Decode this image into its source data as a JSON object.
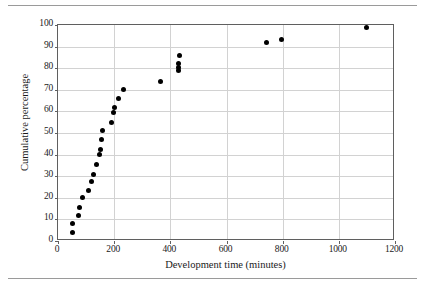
{
  "chart_data": {
    "type": "scatter",
    "title": "",
    "xlabel": "Development time (minutes)",
    "ylabel": "Cumulative percentage",
    "xlim": [
      0,
      1200
    ],
    "ylim": [
      0,
      100
    ],
    "xticks": [
      0,
      200,
      400,
      600,
      800,
      1000,
      1200
    ],
    "yticks": [
      0,
      10,
      20,
      30,
      40,
      50,
      60,
      70,
      80,
      90,
      100
    ],
    "xtick_labels": [
      "0",
      "200",
      "400",
      "600",
      "800",
      "1000",
      "1200"
    ],
    "ytick_labels": [
      "0",
      "10",
      "20",
      "30",
      "40",
      "50",
      "60",
      "70",
      "80",
      "90",
      "100"
    ],
    "grid": "horizontal-and-vertical",
    "legend": "none",
    "marker": "filled-circle",
    "marker_color": "#000000",
    "series": [
      {
        "name": "Cumulative percentage of development times",
        "points": [
          {
            "x": 50,
            "y": 4
          },
          {
            "x": 52,
            "y": 8
          },
          {
            "x": 72,
            "y": 12
          },
          {
            "x": 76,
            "y": 15.5
          },
          {
            "x": 88,
            "y": 20
          },
          {
            "x": 108,
            "y": 23.5
          },
          {
            "x": 120,
            "y": 27.5
          },
          {
            "x": 128,
            "y": 31
          },
          {
            "x": 138,
            "y": 35.5
          },
          {
            "x": 146,
            "y": 40
          },
          {
            "x": 152,
            "y": 42.5
          },
          {
            "x": 155,
            "y": 47
          },
          {
            "x": 160,
            "y": 51
          },
          {
            "x": 190,
            "y": 55
          },
          {
            "x": 198,
            "y": 59.5
          },
          {
            "x": 200,
            "y": 62
          },
          {
            "x": 215,
            "y": 66
          },
          {
            "x": 232,
            "y": 70
          },
          {
            "x": 364,
            "y": 74
          },
          {
            "x": 428,
            "y": 79
          },
          {
            "x": 430,
            "y": 80.5
          },
          {
            "x": 430,
            "y": 82
          },
          {
            "x": 432,
            "y": 86
          },
          {
            "x": 742,
            "y": 92
          },
          {
            "x": 796,
            "y": 93.5
          },
          {
            "x": 1100,
            "y": 99
          }
        ]
      }
    ]
  }
}
